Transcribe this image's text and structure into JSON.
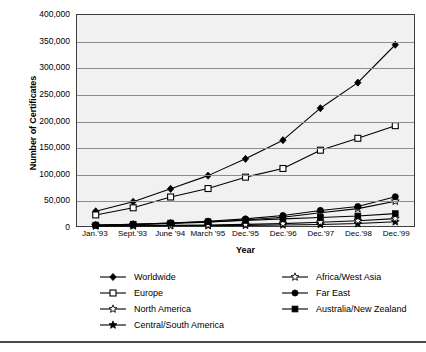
{
  "chart_data": {
    "type": "line",
    "title": "",
    "xlabel": "Year",
    "ylabel": "Number of Certificates",
    "ylim": [
      0,
      400000
    ],
    "ytick_labels": [
      "400,000",
      "350,000",
      "300,000",
      "250,000",
      "200,000",
      "150,000",
      "100,000",
      "50,000",
      "0"
    ],
    "ytick_values": [
      400000,
      350000,
      300000,
      250000,
      200000,
      150000,
      100000,
      50000,
      0
    ],
    "grid": true,
    "legend_position": "below-plot",
    "categories": [
      "Jan.'93",
      "Sept.'93",
      "June '94",
      "March '95",
      "Dec.'95",
      "Dec.'96",
      "Dec.'97",
      "Dec.'98",
      "Dec.'99"
    ],
    "series": [
      {
        "name": "Worldwide",
        "marker": "filled-diamond",
        "values": [
          27800,
          46000,
          70500,
          95500,
          127300,
          162700,
          223300,
          271800,
          343600
        ]
      },
      {
        "name": "Europe",
        "marker": "open-square",
        "values": [
          21000,
          34500,
          55000,
          71000,
          92600,
          109000,
          143700,
          166300,
          190200
        ]
      },
      {
        "name": "North America",
        "marker": "open-star",
        "values": [
          1200,
          2600,
          4800,
          7400,
          11300,
          16500,
          25000,
          33000,
          47000
        ]
      },
      {
        "name": "Central/South America",
        "marker": "filled-star",
        "values": [
          100,
          200,
          400,
          700,
          1200,
          1800,
          2900,
          4600,
          8000
        ]
      },
      {
        "name": "Africa/West Asia",
        "marker": "open-star-small",
        "values": [
          300,
          600,
          1100,
          1900,
          3000,
          4500,
          7000,
          10000,
          14000
        ]
      },
      {
        "name": "Far East",
        "marker": "filled-circle",
        "values": [
          1500,
          3000,
          5500,
          9000,
          13500,
          20000,
          29500,
          37000,
          55500
        ]
      },
      {
        "name": "Australia/New Zealand",
        "marker": "filled-square",
        "values": [
          1800,
          3400,
          5600,
          8000,
          10500,
          13500,
          16200,
          19000,
          23500
        ]
      }
    ]
  },
  "legend": {
    "items": [
      {
        "label": "Worldwide",
        "marker": "filled-diamond",
        "column": 0,
        "row": 0
      },
      {
        "label": "Europe",
        "marker": "open-square",
        "column": 0,
        "row": 1
      },
      {
        "label": "North America",
        "marker": "open-star",
        "column": 0,
        "row": 2
      },
      {
        "label": "Central/South America",
        "marker": "filled-star",
        "column": 0,
        "row": 3
      },
      {
        "label": "Africa/West Asia",
        "marker": "open-star-small",
        "column": 1,
        "row": 0
      },
      {
        "label": "Far East",
        "marker": "filled-circle",
        "column": 1,
        "row": 1
      },
      {
        "label": "Australia/New Zealand",
        "marker": "filled-square",
        "column": 1,
        "row": 2
      }
    ]
  },
  "colors": {
    "ink": "#000000",
    "plot_background": "#f1f1f1",
    "gridline": "#8d8d8d",
    "frame": "#3d3d3d",
    "rule": "#4a4a4a",
    "page_background": "#ffffff"
  }
}
